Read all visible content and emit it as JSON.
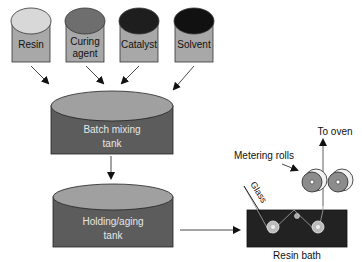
{
  "diagram": {
    "inputs": [
      {
        "label_lines": [
          "Resin"
        ],
        "top_color": "#d8d8d8"
      },
      {
        "label_lines": [
          "Curing",
          "agent"
        ],
        "top_color": "#6e6e6e"
      },
      {
        "label_lines": [
          "Catalyst"
        ],
        "top_color": "#1e1e1e"
      },
      {
        "label_lines": [
          "Solvent"
        ],
        "top_color": "#111111"
      }
    ],
    "batch_tank": {
      "label_lines": [
        "Batch mixing",
        "tank"
      ]
    },
    "holding_tank": {
      "label_lines": [
        "Holding/aging",
        "tank"
      ]
    },
    "resin_bath": {
      "label": "Resin bath"
    },
    "glass": {
      "label": "Glass"
    },
    "metering_rolls": {
      "label": "Metering rolls"
    },
    "to_oven": {
      "label": "To oven"
    },
    "colors": {
      "container_body": "#a8a8a8",
      "tank_body": "#5c5c5c",
      "tank_top": "#a0a0a0",
      "bath": "#222222",
      "roll": "#8c8c8c",
      "text_on_dark": "#e6e6e6",
      "text": "#111111"
    }
  }
}
